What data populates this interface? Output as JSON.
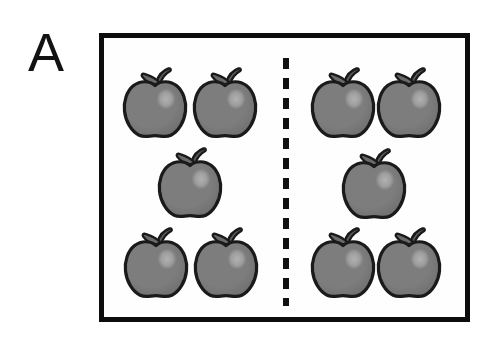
{
  "figure": {
    "panel_label": "A",
    "background_color": "#ffffff",
    "frame": {
      "border_color": "#0d0d0d",
      "fill_color": "#fefefe",
      "border_width_px": 5,
      "x": 99,
      "y": 33,
      "width": 371,
      "height": 289
    },
    "divider": {
      "name": "vertical dashed divider",
      "style": "dashed",
      "color": "#111111",
      "x": 286,
      "y_start": 58,
      "y_end": 306,
      "dash_length_px": 11,
      "gap_length_px": 9,
      "thickness_px": 6
    },
    "item_type": "apple",
    "item_colors": {
      "body_fill": "#7d7d7d",
      "body_shade": "#6e6e6e",
      "outline": "#1a1a1a",
      "highlight": "#b4b4b4",
      "leaf_fill": "#6a6a6a",
      "stem_fill": "#5e5e5e"
    },
    "counts": {
      "left_group": 5,
      "right_group": 5,
      "total": 10
    },
    "apples": [
      {
        "id": "left-top-1",
        "group": "left",
        "row": "top",
        "cx": 155,
        "cy": 101
      },
      {
        "id": "left-top-2",
        "group": "left",
        "row": "top",
        "cx": 225,
        "cy": 101
      },
      {
        "id": "left-middle-1",
        "group": "left",
        "row": "middle",
        "cx": 190,
        "cy": 181
      },
      {
        "id": "left-bottom-1",
        "group": "left",
        "row": "bottom",
        "cx": 156,
        "cy": 261
      },
      {
        "id": "left-bottom-2",
        "group": "left",
        "row": "bottom",
        "cx": 226,
        "cy": 261
      },
      {
        "id": "right-top-1",
        "group": "right",
        "row": "top",
        "cx": 343,
        "cy": 101
      },
      {
        "id": "right-top-2",
        "group": "right",
        "row": "top",
        "cx": 409,
        "cy": 101
      },
      {
        "id": "right-middle-1",
        "group": "right",
        "row": "middle",
        "cx": 374,
        "cy": 182
      },
      {
        "id": "right-bottom-1",
        "group": "right",
        "row": "bottom",
        "cx": 343,
        "cy": 261
      },
      {
        "id": "right-bottom-2",
        "group": "right",
        "row": "bottom",
        "cx": 409,
        "cy": 261
      }
    ]
  }
}
